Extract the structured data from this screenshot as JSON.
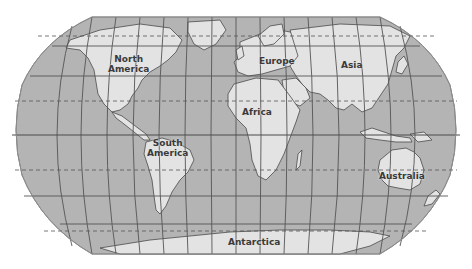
{
  "map": {
    "projection": "Robinson",
    "colors": {
      "ocean": "#b4b4b4",
      "land": "#e3e3e3",
      "grid": "#555555",
      "label": "#3a3a3a",
      "background": "#ffffff"
    },
    "labels": {
      "north_america_1": "North",
      "north_america_2": "America",
      "south_america_1": "South",
      "south_america_2": "America",
      "europe": "Europe",
      "asia": "Asia",
      "africa": "Africa",
      "australia": "Australia",
      "antarctica": "Antarctica"
    },
    "grid_lines": {
      "solid_parallels": [
        "60N",
        "30N",
        "Equator",
        "30S",
        "60S"
      ],
      "dashed_parallels": [
        "Arctic Circle",
        "Tropic of Cancer",
        "Tropic of Capricorn",
        "Antarctic Circle"
      ]
    }
  }
}
